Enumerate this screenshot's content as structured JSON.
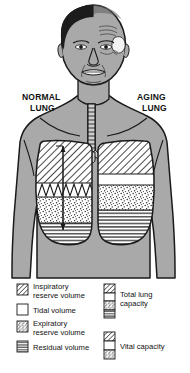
{
  "figure": {
    "title_labels": {
      "left": {
        "line1": "NORMAL",
        "line2": "LUNG"
      },
      "right": {
        "line1": "AGING",
        "line2": "LUNG"
      }
    }
  },
  "colors": {
    "background": "#ffffff",
    "body_fill": "#a9a9a9",
    "outline": "#1a1a1a",
    "hair_dark": "#1c1c1c",
    "lung_white": "#ffffff",
    "hatch_line": "#2a2a2a",
    "stipple_dot": "#3a3a3a",
    "text": "#111111"
  },
  "anatomy": {
    "head": {
      "name": "head",
      "hair_left": "dark-full-hair",
      "hair_right": "balding-receded"
    },
    "trachea": {
      "name": "trachea",
      "rings": 13
    },
    "lungs": {
      "normal": {
        "name": "normal-lung",
        "side": "left",
        "segments": [
          {
            "name": "inspiratory-reserve-volume",
            "pattern": "diagonal-hatch",
            "extent": "large"
          },
          {
            "name": "tidal-volume",
            "pattern": "white-with-zigzag-trace",
            "extent": "band"
          },
          {
            "name": "expiratory-reserve-volume",
            "pattern": "stipple",
            "extent": "medium"
          },
          {
            "name": "residual-volume",
            "pattern": "horizontal-lines",
            "extent": "small"
          }
        ],
        "tidal_trace": "zigzag-breathing-trace",
        "vertical_marker": "vital-capacity-marker-line"
      },
      "aging": {
        "name": "aging-lung",
        "side": "right",
        "segments": [
          {
            "name": "inspiratory-reserve-volume",
            "pattern": "diagonal-hatch",
            "extent": "reduced"
          },
          {
            "name": "tidal-volume",
            "pattern": "white",
            "extent": "band"
          },
          {
            "name": "expiratory-reserve-volume",
            "pattern": "stipple",
            "extent": "reduced"
          },
          {
            "name": "residual-volume",
            "pattern": "horizontal-lines",
            "extent": "enlarged"
          }
        ]
      }
    }
  },
  "legend": {
    "left_column": [
      {
        "id": "inspiratory-reserve-volume",
        "pattern": "diagonal-hatch",
        "line1": "Inspiratory",
        "line2": "reserve volume"
      },
      {
        "id": "tidal-volume",
        "pattern": "white",
        "line1": "Tidal volume",
        "line2": ""
      },
      {
        "id": "expiratory-reserve-volume",
        "pattern": "stipple",
        "line1": "Expiratory",
        "line2": "reserve volume"
      },
      {
        "id": "residual-volume",
        "pattern": "horizontal-lines",
        "line1": "Residual volume",
        "line2": ""
      }
    ],
    "right_column": [
      {
        "id": "total-lung-capacity",
        "stack": [
          "diagonal-hatch",
          "white",
          "stipple",
          "horizontal-lines"
        ],
        "line1": "Total lung",
        "line2": "capacity"
      },
      {
        "id": "vital-capacity",
        "stack": [
          "diagonal-hatch",
          "white",
          "stipple"
        ],
        "line1": "Vital capacity",
        "line2": ""
      }
    ]
  }
}
